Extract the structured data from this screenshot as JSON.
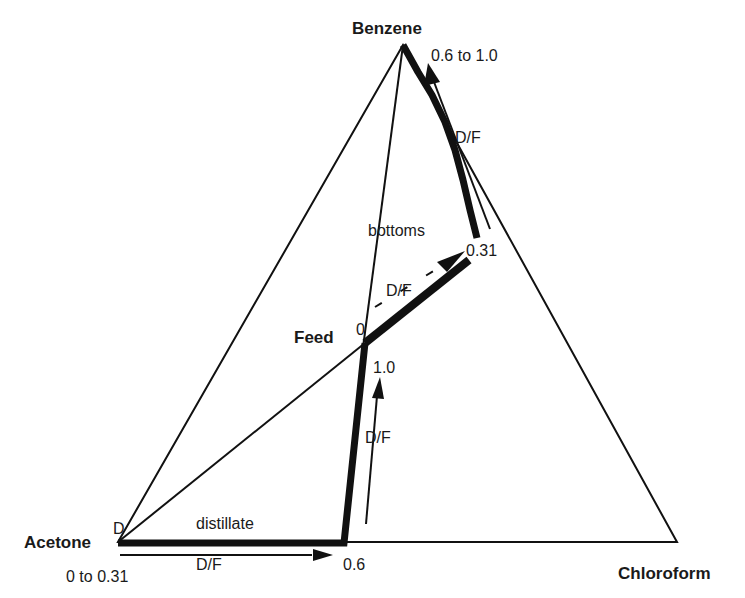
{
  "diagram": {
    "type": "ternary-phase-diagram",
    "vertices": {
      "top": "Benzene",
      "left": "Acetone",
      "right": "Chloroform"
    },
    "labels": {
      "feed": "Feed",
      "distillate": "distillate",
      "bottoms": "bottoms",
      "distillate_point": "D",
      "feed_zero": "0",
      "left_range": "0 to 0.31",
      "bottom_end": "0.6",
      "feed_up_end": "1.0",
      "bottoms_start": "0.31",
      "top_range": "0.6 to 1.0",
      "ratio_bottom": "D/F",
      "ratio_vertical": "D/F",
      "ratio_diagonal": "D/F",
      "ratio_top": "D/F"
    },
    "colors": {
      "line": "#111111",
      "background": "#ffffff"
    }
  }
}
